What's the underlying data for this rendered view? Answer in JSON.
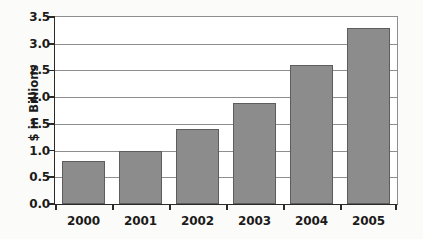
{
  "chart_data": {
    "type": "bar",
    "title": "",
    "xlabel": "",
    "ylabel": "$ in Billions",
    "categories": [
      "2000",
      "2001",
      "2002",
      "2003",
      "2004",
      "2005"
    ],
    "values": [
      0.8,
      1.0,
      1.4,
      1.9,
      2.6,
      3.3
    ],
    "ylim": [
      0.0,
      3.5
    ],
    "ytick_labels": [
      "0.0",
      "0.5",
      "1.0",
      "1.5",
      "2.0",
      "2.5",
      "3.0",
      "3.5"
    ],
    "ytick_values": [
      0.0,
      0.5,
      1.0,
      1.5,
      2.0,
      2.5,
      3.0,
      3.5
    ],
    "grid": true,
    "legend": "none",
    "colors": {
      "bar_fill": "#8c8c8c",
      "bar_edge": "#5d5d5d",
      "axis": "#2a2a2a",
      "gridline": "#8e8e8e",
      "plot_background": "#ffffff",
      "figure_background": "#fbfbf9",
      "text": "#1b1b1b"
    }
  }
}
